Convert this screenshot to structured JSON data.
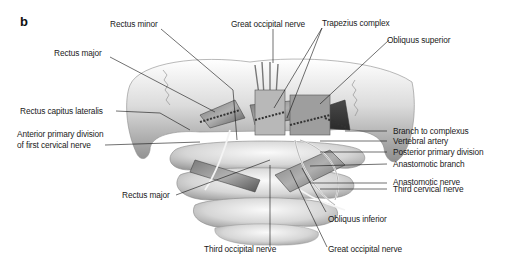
{
  "figure": {
    "panel_letter": "b",
    "illustration": "Posterior view of suboccipital region: occiput, atlas and axis with suboccipital muscles and nerves",
    "labels": {
      "rectus_minor": "Rectus minor",
      "great_occipital_nerve_top": "Great occipital nerve",
      "trapezius_complex": "Trapezius complex",
      "obliquus_superior": "Obliquus superior",
      "rectus_major_upper": "Rectus major",
      "rectus_capitus_lateralis": "Rectus capitus lateralis",
      "anterior_primary_division_line1": "Anterior primary division",
      "anterior_primary_division_line2": "of first cervical nerve",
      "branch_to_complexus": "Branch to complexus",
      "vertebral_artery": "Vertebral artery",
      "posterior_primary_division": "Posterior primary division",
      "anastomotic_branch": "Anastomotic branch",
      "anastomotic_nerve": "Anastomotic nerve",
      "third_cervical_nerve": "Third cervical nerve",
      "rectus_major_lower": "Rectus major",
      "obliquus_inferior": "Obliquus inferior",
      "third_occipital_nerve": "Third occipital nerve",
      "great_occipital_nerve_bottom": "Great occipital nerve"
    }
  }
}
